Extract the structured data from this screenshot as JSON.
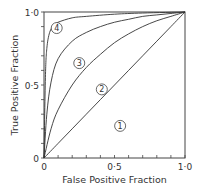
{
  "chart_data": {
    "type": "line",
    "title": "",
    "xlabel": "False Positive Fraction",
    "ylabel": "True Positive Fraction",
    "xlim": [
      0,
      1.0
    ],
    "ylim": [
      0,
      1.0
    ],
    "grid": false,
    "legend": "none (curves labeled with circled numbers)",
    "x_tick_labels": [
      "0",
      "0·5",
      "1·0"
    ],
    "y_tick_labels": [
      "0",
      "0·5",
      "1·0"
    ],
    "minor_tick_step": 0.1,
    "series": [
      {
        "name": "1",
        "x": [
          0,
          0.1,
          0.2,
          0.3,
          0.4,
          0.5,
          0.6,
          0.7,
          0.8,
          0.9,
          1.0
        ],
        "y": [
          0,
          0.1,
          0.2,
          0.3,
          0.4,
          0.5,
          0.6,
          0.7,
          0.8,
          0.9,
          1.0
        ]
      },
      {
        "name": "2",
        "x": [
          0,
          0.05,
          0.1,
          0.2,
          0.3,
          0.4,
          0.5,
          0.6,
          0.7,
          0.8,
          0.9,
          1.0
        ],
        "y": [
          0,
          0.2,
          0.33,
          0.5,
          0.62,
          0.71,
          0.79,
          0.85,
          0.9,
          0.94,
          0.97,
          1.0
        ]
      },
      {
        "name": "3",
        "x": [
          0,
          0.02,
          0.05,
          0.1,
          0.2,
          0.3,
          0.4,
          0.5,
          0.6,
          0.7,
          0.8,
          0.9,
          1.0
        ],
        "y": [
          0,
          0.3,
          0.52,
          0.68,
          0.8,
          0.86,
          0.9,
          0.93,
          0.95,
          0.97,
          0.98,
          0.99,
          1.0
        ]
      },
      {
        "name": "4",
        "x": [
          0,
          0.01,
          0.02,
          0.04,
          0.07,
          0.1,
          0.2,
          0.3,
          0.5,
          0.7,
          1.0
        ],
        "y": [
          0,
          0.55,
          0.75,
          0.86,
          0.91,
          0.93,
          0.96,
          0.97,
          0.985,
          0.993,
          1.0
        ]
      }
    ],
    "curve_labels": [
      {
        "text": "1",
        "x": 0.54,
        "y": 0.22
      },
      {
        "text": "2",
        "x": 0.41,
        "y": 0.47
      },
      {
        "text": "3",
        "x": 0.25,
        "y": 0.65
      },
      {
        "text": "4",
        "x": 0.09,
        "y": 0.89
      }
    ]
  }
}
